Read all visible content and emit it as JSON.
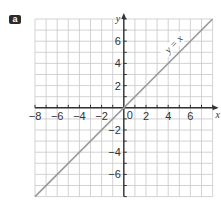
{
  "part_label": "a",
  "chart_data": {
    "type": "line",
    "title": "",
    "xlabel": "x",
    "ylabel": "y",
    "xlim": [
      -8,
      8
    ],
    "ylim": [
      -8,
      8
    ],
    "grid": true,
    "grid_step": 1,
    "x_tick_labels": [
      "-8",
      "-6",
      "-4",
      "-2",
      "2",
      "4",
      "6"
    ],
    "y_tick_labels": [
      "6",
      "4",
      "2",
      "-2",
      "-4",
      "-6"
    ],
    "origin_label": "0",
    "series": [
      {
        "name": "y = x",
        "x": [
          -8,
          8
        ],
        "y": [
          -8,
          8
        ],
        "color": "#9a9a9a"
      }
    ],
    "annotations": [
      {
        "text": "y = x",
        "x": 5,
        "y": 5.6,
        "rotation": -45
      }
    ],
    "legend": "none"
  },
  "colors": {
    "grid": "#c8c8c8",
    "axis": "#333333",
    "line": "#9a9a9a",
    "badge": "#2b2b2b"
  }
}
